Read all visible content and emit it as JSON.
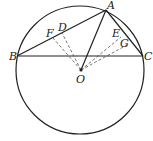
{
  "diagram": {
    "type": "geometry",
    "circle": {
      "center": "O",
      "cx": 80,
      "cy": 70,
      "r": 64
    },
    "points": {
      "A": {
        "label": "A",
        "x": 106,
        "y": 10
      },
      "B": {
        "label": "B",
        "x": 17,
        "y": 56
      },
      "C": {
        "label": "C",
        "x": 143,
        "y": 56
      },
      "O": {
        "label": "O",
        "x": 81,
        "y": 70
      },
      "D": {
        "label": "D",
        "x": 62,
        "y": 33
      },
      "F": {
        "label": "F",
        "x": 53,
        "y": 38
      },
      "E": {
        "label": "E",
        "x": 121,
        "y": 37
      },
      "G": {
        "label": "G",
        "x": 127,
        "y": 45
      }
    },
    "solid_segments": [
      "AB",
      "AC",
      "BC",
      "AO"
    ],
    "dashed_segments": [
      "OD",
      "OF",
      "OE",
      "OG"
    ],
    "colors": {
      "stroke": "#222222",
      "dashed": "#555555",
      "background": "#ffffff"
    }
  }
}
